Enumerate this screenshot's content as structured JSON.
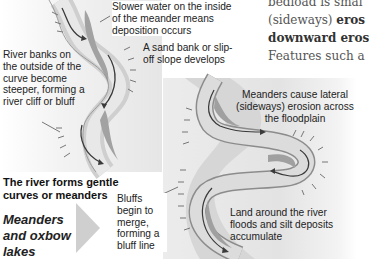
{
  "diagram": {
    "title": "Meanders and oxbow lakes",
    "left_panel": {
      "caption": "The river forms gentle curves or meanders",
      "labels": {
        "slower_water": "Slower water on the inside of the meander means deposition occurs",
        "sand_bank": "A sand bank or slip-off slope develops",
        "river_banks": "River banks on the outside of the curve become steeper, forming a river cliff or bluff"
      }
    },
    "right_panel": {
      "labels": {
        "lateral_erosion": "Meanders cause lateral (sideways) erosion across the floodplain",
        "land_floods": "Land around the river floods and silt deposits accumulate",
        "bluffs_merge": "Bluffs begin to merge, forming a bluff line"
      }
    },
    "book_text": {
      "line1": "bedload is smal",
      "line2_plain": "(sideways) ",
      "line2_bold": "eros",
      "line3_bold": "downward eros",
      "line4": "Features such a"
    },
    "colors": {
      "river_light": "#d4d4d4",
      "river_dark": "#9a9a9a",
      "river_edge": "#8a8a8a",
      "arrow": "#3a3a3a",
      "panel_bg": "#e6e6e6",
      "big_arrow": "#cfcfcf"
    }
  }
}
